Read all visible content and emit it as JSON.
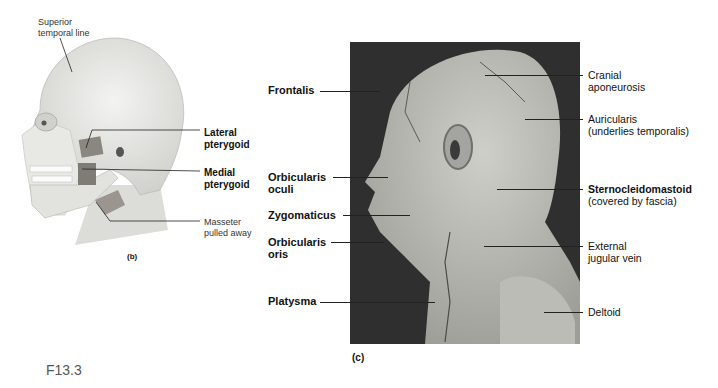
{
  "figure_id": "F13.3",
  "panel_b": {
    "caption": "(b)",
    "labels": {
      "superior_temporal_line": [
        "Superior",
        "temporal line"
      ],
      "lateral_pterygoid": [
        "Lateral",
        "pterygoid"
      ],
      "medial_pterygoid": [
        "Medial",
        "pterygoid"
      ],
      "masseter": [
        "Masseter",
        "pulled away"
      ]
    }
  },
  "panel_c": {
    "caption": "(c)",
    "left_labels": {
      "frontalis": [
        "Frontalis"
      ],
      "orbicularis_oculi": [
        "Orbicularis",
        "oculi"
      ],
      "zygomaticus": [
        "Zygomaticus"
      ],
      "orbicularis_oris": [
        "Orbicularis",
        "oris"
      ],
      "platysma": [
        "Platysma"
      ]
    },
    "right_labels": {
      "cranial_aponeurosis": [
        "Cranial",
        "aponeurosis"
      ],
      "auricularis": [
        "Auricularis",
        "(underlies temporalis)"
      ],
      "sternocleidomastoid": [
        "Sternocleidomastoid",
        "(covered by fascia)"
      ],
      "external_jugular_vein": [
        "External",
        "jugular vein"
      ],
      "deltoid": [
        "Deltoid"
      ]
    }
  },
  "colors": {
    "photo_background": "#2f2f2f",
    "tissue": "#b9b9b4",
    "skull": "#e6e6e2",
    "muscle": "#8a8680",
    "leader_line": "#222222"
  }
}
